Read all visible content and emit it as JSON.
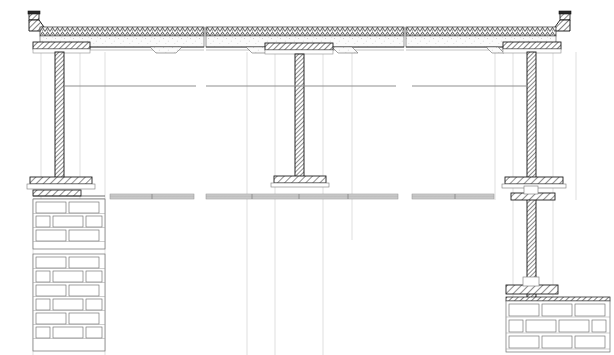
{
  "document": {
    "title": "Reinforced concrete frame — building section details",
    "type": "architectural-structural-section",
    "sheet_width": 614,
    "sheet_height": 355,
    "background_color": "#ffffff",
    "line_color": "#1a1a1a",
    "thin_line_color": "#8a8a8a",
    "faint_line_color": "#b8b8b8",
    "hatch_color": "#2b2b2b",
    "concrete_fill": "#f2f2f2",
    "brick_fill": "#ffffff",
    "brick_outline": "#6e6e6e"
  },
  "panels": [
    {
      "id": "panel-left",
      "name": "left-edge-column-detail",
      "x": 18,
      "width": 186,
      "description": "Edge column with parapet, roof slab, column over brick pier"
    },
    {
      "id": "panel-middle",
      "name": "interior-column-detail",
      "x": 204,
      "width": 200,
      "description": "Interior column with slab haunch and spread footing"
    },
    {
      "id": "panel-right",
      "name": "right-edge-column-detail",
      "x": 404,
      "width": 192,
      "description": "Edge column with parapet, roof slab, column over brick foundation"
    }
  ],
  "elements": {
    "roof_slab": {
      "name": "roof-slab",
      "top_y": 26,
      "bottom_y": 50,
      "hatch_band_height": 9,
      "layers": [
        {
          "name": "insulation-hatch",
          "pattern": "dense-dot-hatch"
        },
        {
          "name": "concrete-slab",
          "pattern": "stipple"
        },
        {
          "name": "soffit-line",
          "pattern": "solid"
        }
      ]
    },
    "parapet": {
      "name": "parapet-fascia",
      "height": 18,
      "top_y": 12
    },
    "columns": [
      {
        "name": "column-left",
        "cx": 59,
        "top_y": 52,
        "bottom_y": 183,
        "width": 9
      },
      {
        "name": "column-middle",
        "cx": 299,
        "top_y": 52,
        "bottom_y": 182,
        "width": 9
      },
      {
        "name": "column-right",
        "cx": 531,
        "top_y": 52,
        "bottom_y": 300,
        "width": 9
      }
    ],
    "capitals": [
      {
        "name": "capital-left",
        "cx": 59,
        "y": 47,
        "w": 58
      },
      {
        "name": "capital-middle",
        "cx": 299,
        "y": 47,
        "w": 68
      },
      {
        "name": "capital-right",
        "cx": 531,
        "y": 47,
        "w": 60
      }
    ],
    "column_bases": [
      {
        "name": "base-left",
        "cx": 59,
        "y": 179,
        "w": 64
      },
      {
        "name": "base-middle",
        "cx": 299,
        "y": 178,
        "w": 52
      },
      {
        "name": "base-right-upper",
        "cx": 531,
        "y": 179,
        "w": 60
      },
      {
        "name": "base-right-lower",
        "cx": 531,
        "y": 196,
        "w": 44
      },
      {
        "name": "base-right-footing",
        "cx": 531,
        "y": 288,
        "w": 50
      }
    ],
    "grade_bands": [
      {
        "name": "grade-band-left",
        "x": 110,
        "y": 195,
        "w": 84,
        "h": 5
      },
      {
        "name": "grade-band-middle",
        "x": 206,
        "y": 195,
        "w": 192,
        "h": 5
      },
      {
        "name": "grade-band-right",
        "x": 412,
        "y": 195,
        "w": 82,
        "h": 5
      }
    ],
    "ceiling_lines": [
      {
        "name": "ceiling-line-left",
        "x1": 64,
        "x2": 196,
        "y": 86
      },
      {
        "name": "ceiling-line-middle",
        "x1": 206,
        "x2": 396,
        "y": 86
      },
      {
        "name": "ceiling-line-right",
        "x1": 412,
        "x2": 528,
        "y": 86
      }
    ],
    "brick_piers": [
      {
        "name": "brick-pier-left-upper",
        "x": 33,
        "y": 199,
        "w": 72,
        "h": 50,
        "courses": 3,
        "course_height": 16.5
      },
      {
        "name": "brick-pier-left-lower",
        "x": 33,
        "y": 254,
        "w": 72,
        "h": 97,
        "courses": 6,
        "course_height": 16.2
      },
      {
        "name": "brick-footing-right",
        "x": 506,
        "y": 300,
        "w": 104,
        "h": 52,
        "courses": 3,
        "course_height": 17.3
      }
    ],
    "reference_lines": [
      {
        "name": "ref-line-l1",
        "x": 41
      },
      {
        "name": "ref-line-l2",
        "x": 80
      },
      {
        "name": "ref-line-l3",
        "x": 105
      },
      {
        "name": "ref-line-m1",
        "x": 275
      },
      {
        "name": "ref-line-m2",
        "x": 323
      },
      {
        "name": "ref-line-r1",
        "x": 513
      },
      {
        "name": "ref-line-r2",
        "x": 553
      },
      {
        "name": "ref-line-r3",
        "x": 576
      }
    ]
  },
  "labels": {
    "sheet_caption": "",
    "notes": []
  }
}
